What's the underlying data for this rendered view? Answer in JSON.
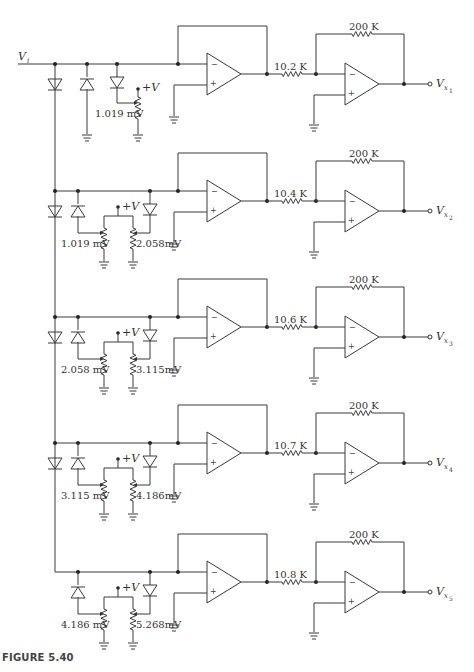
{
  "figure": {
    "caption": "FIGURE 5.40",
    "input_label": "V",
    "input_sub": "i",
    "supply_label": "+V",
    "minus_sign": "−",
    "plus_sign": "+",
    "stages": [
      {
        "id": 1,
        "y": 64,
        "input_resistor": "10.2 K",
        "feedback_resistor": "200 K",
        "output_label": "V",
        "output_sub": "x",
        "output_sub2": "1",
        "ref_low": "1.019 mV",
        "ref_high": null
      },
      {
        "id": 2,
        "y": 191,
        "input_resistor": "10.4 K",
        "feedback_resistor": "200 K",
        "output_label": "V",
        "output_sub": "x",
        "output_sub2": "2",
        "ref_low": "1.019 mV",
        "ref_high": "2.058mV"
      },
      {
        "id": 3,
        "y": 317,
        "input_resistor": "10.6 K",
        "feedback_resistor": "200 K",
        "output_label": "V",
        "output_sub": "x",
        "output_sub2": "3",
        "ref_low": "2.058 mV",
        "ref_high": "3.115mV"
      },
      {
        "id": 4,
        "y": 443,
        "input_resistor": "10.7 K",
        "feedback_resistor": "200 K",
        "output_label": "V",
        "output_sub": "x",
        "output_sub2": "4",
        "ref_low": "3.115 mV",
        "ref_high": "4.186mV"
      },
      {
        "id": 5,
        "y": 572,
        "input_resistor": "10.8 K",
        "feedback_resistor": "200 K",
        "output_label": "V",
        "output_sub": "x",
        "output_sub2": "5",
        "ref_low": "4.186 mV",
        "ref_high": "5.268mV"
      }
    ]
  }
}
